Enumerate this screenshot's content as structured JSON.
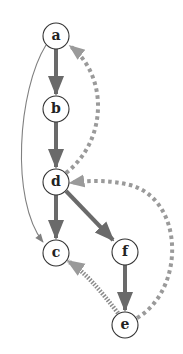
{
  "colors": {
    "solid_edge": "#6a6a6a",
    "dashed_edge": "#9a9a9a",
    "thin_edge": "#808080",
    "node_stroke": "#333333",
    "node_fill": "#ffffff",
    "label": "#222222"
  },
  "nodes": [
    {
      "id": "a",
      "label": "a",
      "x": 56,
      "y": 36
    },
    {
      "id": "b",
      "label": "b",
      "x": 56,
      "y": 109
    },
    {
      "id": "d",
      "label": "d",
      "x": 56,
      "y": 182
    },
    {
      "id": "c",
      "label": "c",
      "x": 56,
      "y": 253
    },
    {
      "id": "f",
      "label": "f",
      "x": 125,
      "y": 252
    },
    {
      "id": "e",
      "label": "e",
      "x": 125,
      "y": 325
    }
  ],
  "edges": [
    {
      "from": "a",
      "to": "b",
      "style": "solid-thick"
    },
    {
      "from": "b",
      "to": "d",
      "style": "solid-thick"
    },
    {
      "from": "d",
      "to": "c",
      "style": "solid-thick"
    },
    {
      "from": "d",
      "to": "f",
      "style": "solid-thick"
    },
    {
      "from": "f",
      "to": "e",
      "style": "solid-thick"
    },
    {
      "from": "a",
      "to": "c",
      "style": "thin-curved"
    },
    {
      "from": "d",
      "to": "a",
      "style": "dashed-curved"
    },
    {
      "from": "e",
      "to": "d",
      "style": "dashed-curved"
    },
    {
      "from": "e",
      "to": "c",
      "style": "dashed-thick"
    }
  ]
}
